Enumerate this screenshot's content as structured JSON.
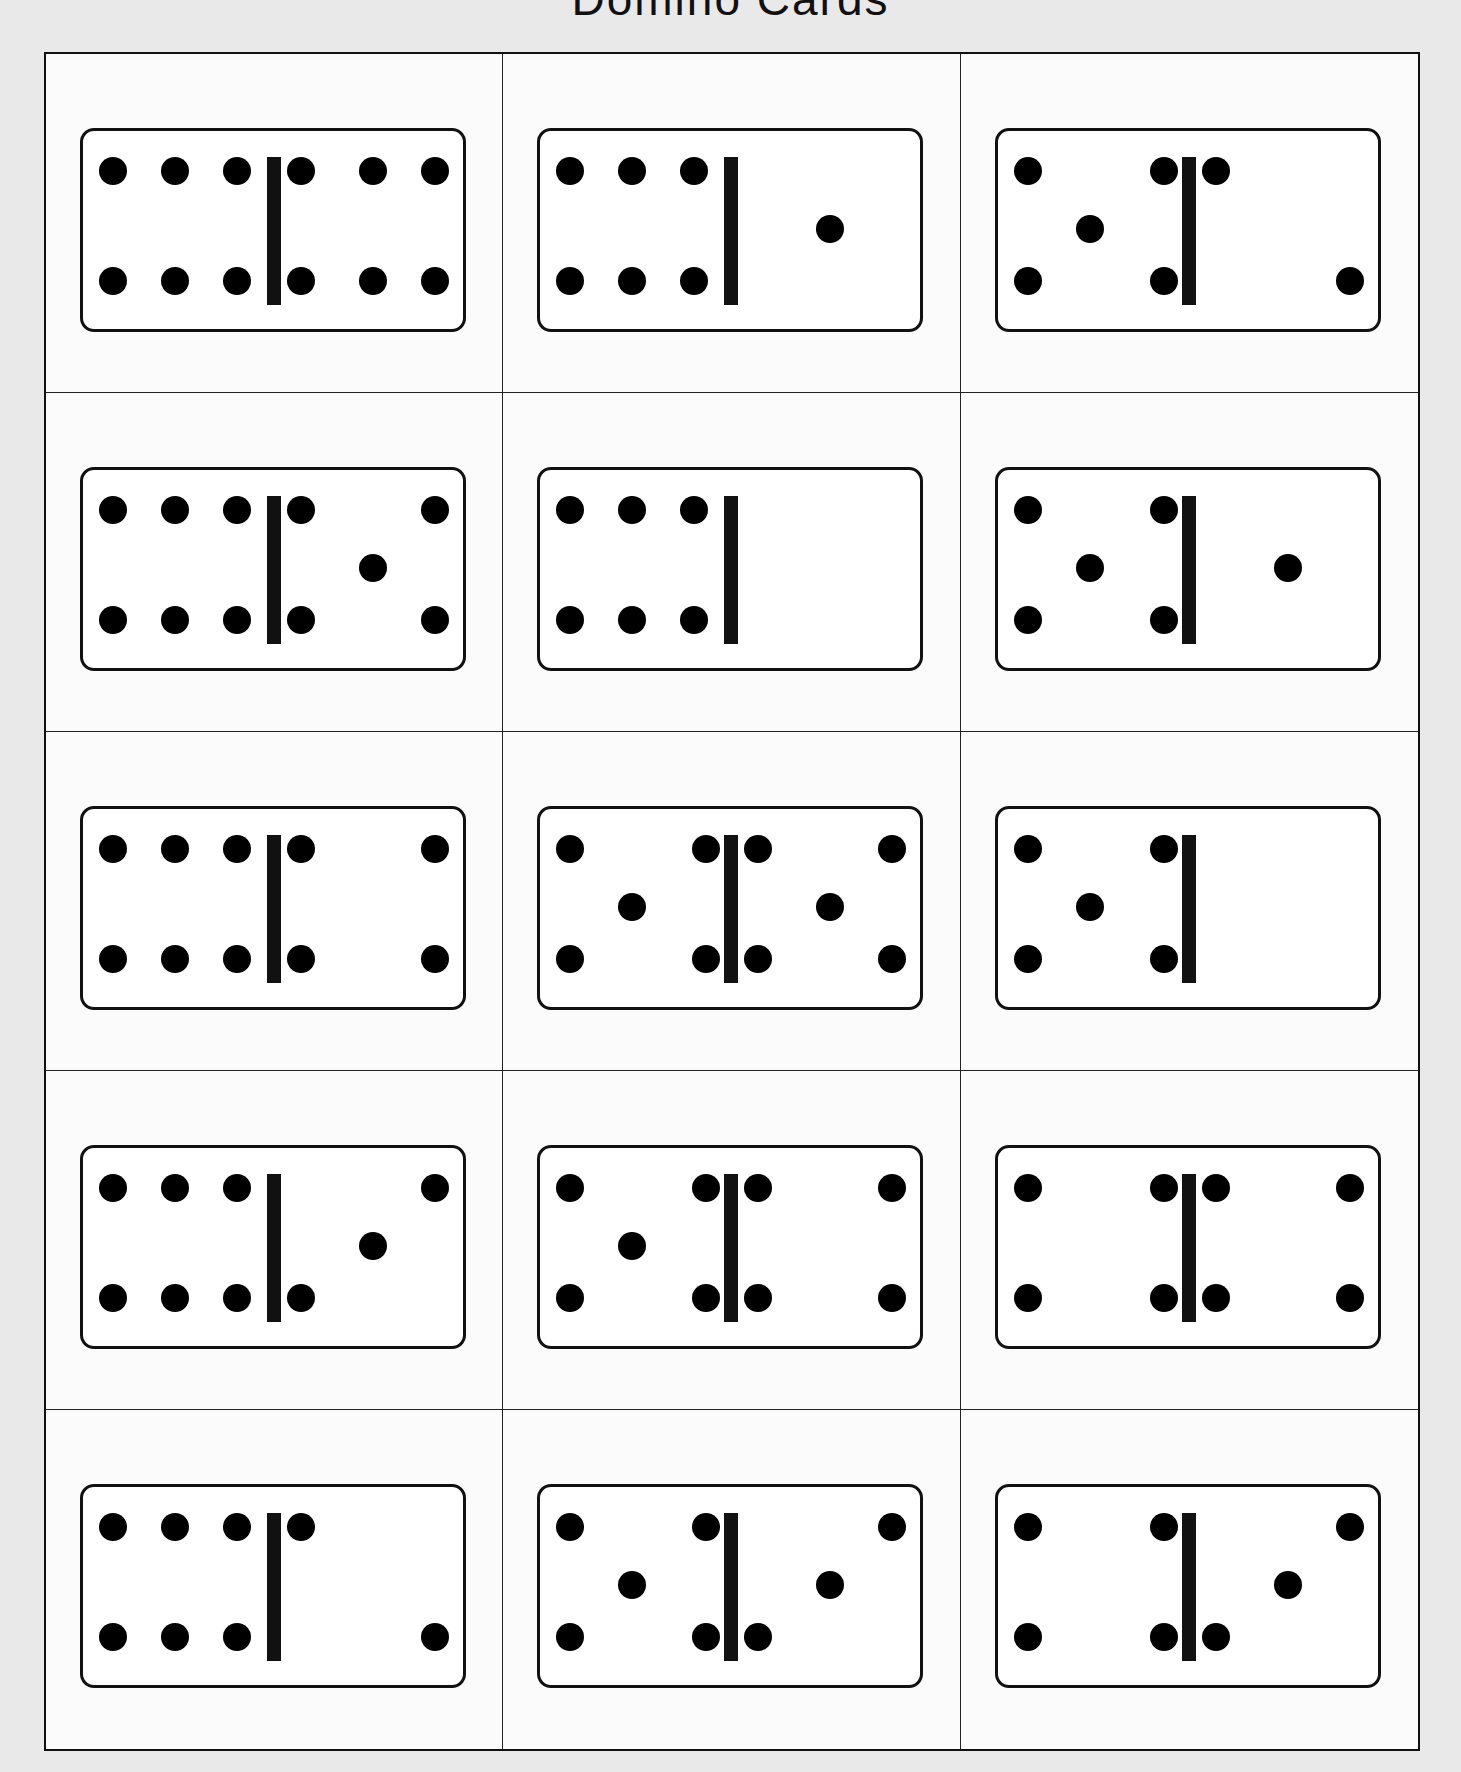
{
  "title": "Domino Cards",
  "colors": {
    "ink": "#000000",
    "paper": "#fbfbfb",
    "background": "#e9e9e9"
  },
  "dominoes": [
    {
      "left": 6,
      "right": 6
    },
    {
      "left": 6,
      "right": 1
    },
    {
      "left": 5,
      "right": 2
    },
    {
      "left": 6,
      "right": 5
    },
    {
      "left": 6,
      "right": 0
    },
    {
      "left": 5,
      "right": 1
    },
    {
      "left": 6,
      "right": 4
    },
    {
      "left": 5,
      "right": 5
    },
    {
      "left": 5,
      "right": 0
    },
    {
      "left": 6,
      "right": 3
    },
    {
      "left": 5,
      "right": 4
    },
    {
      "left": 4,
      "right": 4
    },
    {
      "left": 6,
      "right": 2
    },
    {
      "left": 5,
      "right": 3
    },
    {
      "left": 4,
      "right": 3
    }
  ]
}
